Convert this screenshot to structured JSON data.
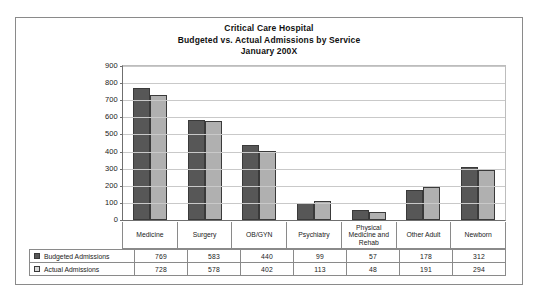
{
  "figure": {
    "title_lines": [
      "Critical Care Hospital",
      "Budgeted vs. Actual Admissions by Service",
      "January 200X"
    ]
  },
  "chart_data": {
    "type": "bar",
    "title": "Critical Care Hospital Budgeted vs. Actual Admissions by Service January 200X",
    "xlabel": "",
    "ylabel": "",
    "ylim": [
      0,
      900
    ],
    "yticks": [
      900,
      800,
      700,
      600,
      500,
      400,
      300,
      200,
      100,
      0
    ],
    "grid": true,
    "legend_position": "bottom-table",
    "categories": [
      "Medicine",
      "Surgery",
      "OB/GYN",
      "Psychiatry",
      "Physical Medicine and Rehab",
      "Other Adult",
      "Newborn"
    ],
    "series": [
      {
        "name": "Budgeted Admissions",
        "color": "#575757",
        "values": [
          769,
          583,
          440,
          99,
          57,
          178,
          312
        ]
      },
      {
        "name": "Actual Admissions",
        "color": "#b0b0b0",
        "values": [
          728,
          578,
          402,
          113,
          48,
          191,
          294
        ]
      }
    ]
  }
}
